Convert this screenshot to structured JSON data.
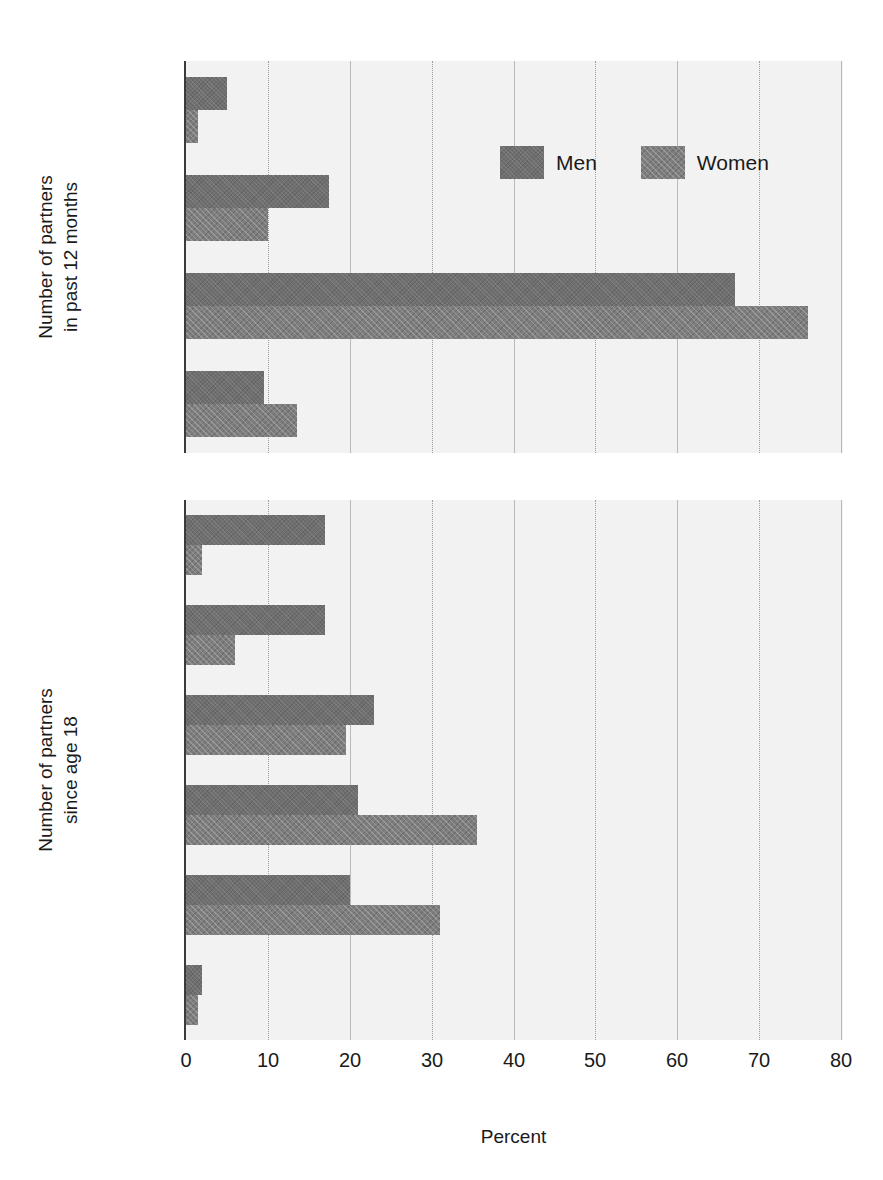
{
  "legend": {
    "items": [
      {
        "label": "Men",
        "color": "#6f6f6f",
        "key": "men"
      },
      {
        "label": "Women",
        "color": "#7e7e7e",
        "key": "women"
      }
    ]
  },
  "axis": {
    "x_title": "Percent",
    "x_ticks": [
      "0",
      "10",
      "20",
      "30",
      "40",
      "50",
      "60",
      "70",
      "80"
    ],
    "x_min": 0,
    "x_max": 80
  },
  "panels": [
    {
      "id": "past-12-months",
      "y_title_line1": "Number of partners",
      "y_title_line2": "in past 12 months",
      "categories": [
        "0",
        "1",
        "2–4",
        "5+"
      ],
      "series": [
        {
          "name": "Men",
          "values": [
            9.5,
            67.0,
            17.5,
            5.0
          ]
        },
        {
          "name": "Women",
          "values": [
            13.5,
            76.0,
            10.0,
            1.5
          ]
        }
      ]
    },
    {
      "id": "since-age-18",
      "y_title_line1": "Number of partners",
      "y_title_line2": "since age 18",
      "categories": [
        "0",
        "1",
        "2–4",
        "5–9",
        "10–20",
        "21+"
      ],
      "series": [
        {
          "name": "Men",
          "values": [
            2.0,
            20.0,
            21.0,
            23.0,
            17.0,
            17.0
          ]
        },
        {
          "name": "Women",
          "values": [
            1.5,
            31.0,
            35.5,
            19.5,
            6.0,
            2.0
          ]
        }
      ]
    }
  ],
  "chart_data": {
    "type": "bar",
    "orientation": "horizontal",
    "title": "",
    "xlabel": "Percent",
    "ylabel": "Number of partners",
    "xlim": [
      0,
      80
    ],
    "xticks": [
      0,
      10,
      20,
      30,
      40,
      50,
      60,
      70,
      80
    ],
    "grid": "vertical",
    "legend": [
      "Men",
      "Women"
    ],
    "legend_position": "top-center-right",
    "panels": [
      {
        "ylabel": "Number of partners in past 12 months",
        "categories": [
          "0",
          "1",
          "2–4",
          "5+"
        ],
        "series": [
          {
            "name": "Men",
            "values": [
              9.5,
              67.0,
              17.5,
              5.0
            ]
          },
          {
            "name": "Women",
            "values": [
              13.5,
              76.0,
              10.0,
              1.5
            ]
          }
        ]
      },
      {
        "ylabel": "Number of partners since age 18",
        "categories": [
          "0",
          "1",
          "2–4",
          "5–9",
          "10–20",
          "21+"
        ],
        "series": [
          {
            "name": "Men",
            "values": [
              2.0,
              20.0,
              21.0,
              23.0,
              17.0,
              17.0
            ]
          },
          {
            "name": "Women",
            "values": [
              1.5,
              31.0,
              35.5,
              19.5,
              6.0,
              2.0
            ]
          }
        ]
      }
    ]
  }
}
